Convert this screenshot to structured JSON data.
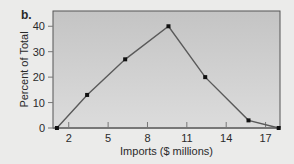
{
  "panel_label": "b.",
  "colors": {
    "background": "#ebebea",
    "plot_top": "#c4c4c4",
    "plot_bottom": "#dcdcdc",
    "line": "#5a5a5a",
    "marker": "#111111",
    "axis": "#777777",
    "frame": "#555555"
  },
  "chart_data": {
    "type": "line",
    "title": "",
    "xlabel": "Imports ($ millions)",
    "ylabel": "Percent of Total",
    "x": [
      1.1,
      3.4,
      6.3,
      9.6,
      12.4,
      15.7,
      18.0
    ],
    "series": [
      {
        "name": "Percent of Total",
        "values": [
          0,
          13,
          27,
          40,
          20,
          3,
          0
        ]
      }
    ],
    "xticks": [
      2,
      5,
      8,
      11,
      14,
      17
    ],
    "yticks": [
      0,
      10,
      20,
      30,
      40
    ],
    "xlim": [
      0.8,
      18.1
    ],
    "ylim": [
      0,
      46
    ],
    "grid": false,
    "legend": null,
    "markers": true
  }
}
